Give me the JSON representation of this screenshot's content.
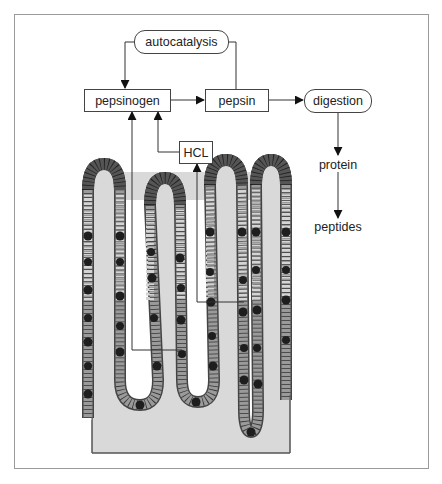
{
  "diagram": {
    "type": "flowchart-with-illustration",
    "nodes": {
      "autocatalysis": "autocatalysis",
      "pepsinogen": "pepsinogen",
      "pepsin": "pepsin",
      "digestion": "digestion",
      "hcl": "HCL",
      "protein": "protein",
      "peptides": "peptides"
    },
    "edges": [
      {
        "from": "pepsin",
        "to": "autocatalysis"
      },
      {
        "from": "autocatalysis",
        "to": "pepsinogen"
      },
      {
        "from": "pepsinogen",
        "to": "pepsin"
      },
      {
        "from": "pepsin",
        "to": "digestion"
      },
      {
        "from": "digestion",
        "to": "protein"
      },
      {
        "from": "protein",
        "to": "peptides"
      },
      {
        "from": "hcl",
        "to": "pepsinogen"
      },
      {
        "from": "gastric-gland-chief-cells",
        "to": "pepsinogen"
      },
      {
        "from": "gastric-gland-parietal-cells",
        "to": "hcl"
      }
    ],
    "illustration": "gastric mucosa with four villi / gastric glands",
    "colors": {
      "line": "#333333",
      "frame": "#9a9a9a",
      "tissue_fill": "#d9d9d9",
      "cell_dark": "#2a2a2a",
      "cell_mid": "#7a7a7a",
      "cell_light": "#c8c8c8"
    }
  }
}
